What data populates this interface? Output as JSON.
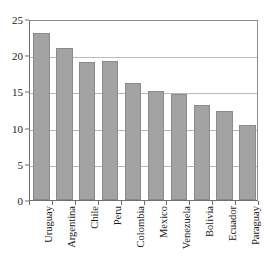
{
  "chart_data": {
    "type": "bar",
    "title": "",
    "subtitle": "",
    "xlabel": "",
    "ylabel": "",
    "categories": [
      "Uruguay",
      "Argentina",
      "Chile",
      "Peru",
      "Colombia",
      "Mexico",
      "Venezuela",
      "Bolivia",
      "Ecuador",
      "Paraguay"
    ],
    "values": [
      23.1,
      21.0,
      19.1,
      19.2,
      16.2,
      15.1,
      14.7,
      13.1,
      12.3,
      10.3
    ],
    "ylim": [
      0,
      25
    ],
    "yticks": [
      0,
      5,
      10,
      15,
      20,
      25
    ],
    "ytick_labels": [
      "0",
      "5",
      "10",
      "15",
      "20",
      "25"
    ],
    "grid": true,
    "grid_axis": "y",
    "legend": false,
    "legend_position": "none",
    "annotations": [],
    "bar_color": "#a3a3a3",
    "bar_edge_color": "#8a8a8a",
    "grid_color": "#b9b9b9",
    "axis_color": "#6f6f6f",
    "background_color": "#ffffff",
    "text_color": "#1a1a1a",
    "xtick_label_rotation": 90
  }
}
